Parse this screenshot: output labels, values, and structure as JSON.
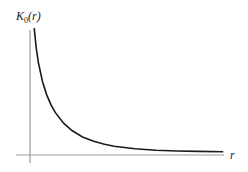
{
  "chart_data": {
    "type": "line",
    "title": "",
    "xlabel": "r",
    "ylabel": "K0(r)",
    "ylabel_main": "K",
    "ylabel_sub": "0",
    "ylabel_arg": "(r)",
    "grid": false,
    "legend": null,
    "series": [
      {
        "name": "K0(r)",
        "x": [
          0.1,
          0.15,
          0.2,
          0.3,
          0.4,
          0.5,
          0.6,
          0.8,
          1.0,
          1.25,
          1.5,
          1.75,
          2.0,
          2.5,
          3.0,
          3.5,
          4.0,
          4.6
        ],
        "y": [
          2.427,
          2.03,
          1.753,
          1.372,
          1.115,
          0.924,
          0.777,
          0.565,
          0.421,
          0.294,
          0.214,
          0.157,
          0.114,
          0.062,
          0.035,
          0.02,
          0.011,
          0.006
        ]
      }
    ],
    "xlim": [
      -0.3,
      4.6
    ],
    "ylim": [
      -0.1,
      2.5
    ],
    "colors": {
      "curve": "#1a1a1a",
      "axis": "#9a9a9a"
    }
  }
}
